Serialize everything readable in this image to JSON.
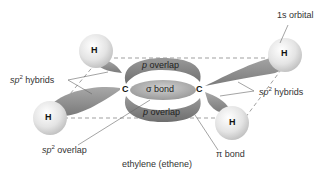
{
  "diagram": {
    "title": "ethylene (ethene)",
    "type": "molecular orbital diagram",
    "labels": {
      "s_orbital": "1s orbital",
      "sp2_hybrids_left_prefix": "sp",
      "sp2_hybrids_left_sup": "2",
      "sp2_hybrids_left_suffix": " hybrids",
      "sp2_hybrids_right_prefix": "sp",
      "sp2_hybrids_right_sup": "2",
      "sp2_hybrids_right_suffix": " hybrids",
      "sp2_overlap_prefix": "sp",
      "sp2_overlap_sup": "2",
      "sp2_overlap_suffix": " overlap",
      "pi_bond": "π bond",
      "p_overlap_top_p": "p",
      "p_overlap_top_rest": " overlap",
      "p_overlap_bottom_p": "p",
      "p_overlap_bottom_rest": " overlap",
      "sigma_bond": "σ bond"
    },
    "atoms": {
      "carbon_left": "C",
      "carbon_right": "C",
      "h_top_left": "H",
      "h_bottom_left": "H",
      "h_top_right": "H",
      "h_bottom_right": "H"
    },
    "colors": {
      "lobe": "#8a8a8a",
      "lobe_light": "#b5b5b5",
      "sphere": "#e6e6e6",
      "dashed_line": "#777777",
      "text": "#333333"
    }
  }
}
